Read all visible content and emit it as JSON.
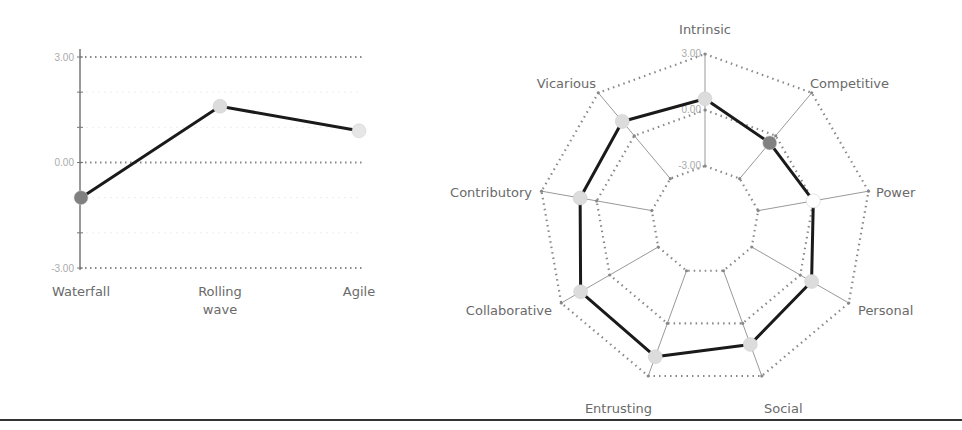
{
  "chart_data": [
    {
      "type": "line",
      "title": "",
      "xlabel": "",
      "ylabel": "",
      "categories": [
        "Waterfall",
        "Rolling wave",
        "Agile"
      ],
      "category_lines": [
        [
          "Waterfall"
        ],
        [
          "Rolling",
          "wave"
        ],
        [
          "Agile"
        ]
      ],
      "values": [
        -1.0,
        1.6,
        0.9
      ],
      "marker_colors": [
        "#808080",
        "#dcdcdc",
        "#e6e6e6"
      ],
      "ylim": [
        -3,
        3
      ],
      "y_ticks": [
        "3.00",
        "0.00",
        "-3.00"
      ],
      "y_tick_values": [
        3,
        0,
        -3
      ],
      "grid": true,
      "legend": "none"
    },
    {
      "type": "radar",
      "title": "",
      "axes": [
        "Intrinsic",
        "Competitive",
        "Power",
        "Personal",
        "Social",
        "Entrusting",
        "Collaborative",
        "Contributory",
        "Vicarious"
      ],
      "values": [
        0.6,
        -0.5,
        0.0,
        0.7,
        1.2,
        1.9,
        1.8,
        0.9,
        1.0
      ],
      "marker_colors": [
        "#dcdcdc",
        "#808080",
        "#ffffff",
        "#dcdcdc",
        "#dcdcdc",
        "#dcdcdc",
        "#dcdcdc",
        "#dcdcdc",
        "#dcdcdc"
      ],
      "range": [
        -3,
        3
      ],
      "ring_labels": [
        "3.00",
        "0.00",
        "-3.00"
      ],
      "ring_values": [
        3,
        0,
        -3
      ],
      "grid": true,
      "legend": "none"
    }
  ],
  "colors": {
    "line": "#1a1a1a",
    "grid": "#888888",
    "axis": "#777777",
    "label": "#6a6a6a",
    "tick": "#aaaaaa",
    "divider": "#333333"
  }
}
